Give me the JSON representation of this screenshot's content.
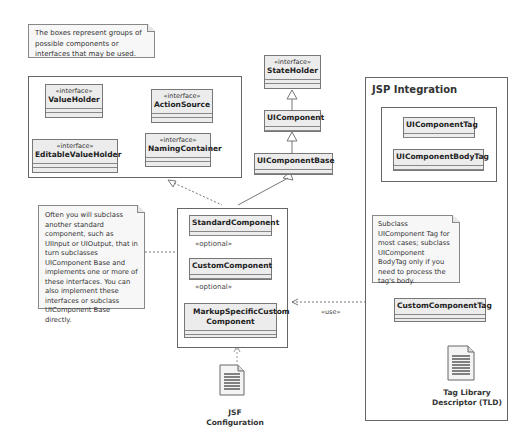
{
  "notes": {
    "top": "The boxes represent groups of possible components or interfaces that may be used.",
    "left": "Often you will subclass another standard component, such as UIInput or UIOutput, that in turn subclasses UIComponent Base and implements one or more of these interfaces. You can also implement these interfaces or subclass UIComponent Base directly.",
    "right": "Subclass UIComponent Tag for most cases; subclass UIComponent BodyTag only if you need to process the tag's body."
  },
  "stereotype": "«interface»",
  "interfaces_group": {
    "items": [
      {
        "name": "ValueHolder"
      },
      {
        "name": "EditableValueHolder"
      },
      {
        "name": "ActionSource"
      },
      {
        "name": "NamingContainer"
      }
    ]
  },
  "hierarchy": {
    "state_holder": "StateHolder",
    "ui_component": "UIComponent",
    "ui_component_base": "UIComponentBase"
  },
  "components_group": {
    "standard": "StandardComponent",
    "custom": "CustomComponent",
    "markup": "MarkupSpecificCustom Component",
    "optional_label": "«optional»"
  },
  "jsp": {
    "title": "JSP Integration",
    "tag": "UIComponentTag",
    "body_tag": "UIComponentBodyTag",
    "custom_tag": "CustomComponentTag",
    "tld_label": "Tag Library Descriptor (TLD)"
  },
  "jsf_config_label": "JSF Configuration",
  "use_label": "«use»"
}
